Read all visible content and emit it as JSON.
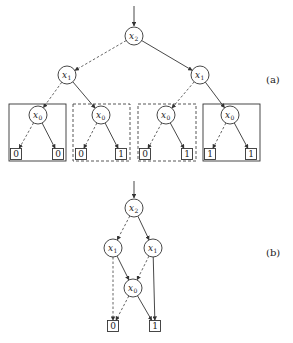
{
  "diagram_a": {
    "label": "(a)",
    "root_arrow": {
      "x": 134,
      "y1": 6,
      "y2": 26
    },
    "nodes": [
      {
        "id": "a-x2",
        "var": "x",
        "sub": "2",
        "cx": 134,
        "cy": 36
      },
      {
        "id": "a-x1-left",
        "var": "x",
        "sub": "1",
        "cx": 67,
        "cy": 75
      },
      {
        "id": "a-x1-right",
        "var": "x",
        "sub": "1",
        "cx": 200,
        "cy": 75
      },
      {
        "id": "a-x0-1",
        "var": "x",
        "sub": "0",
        "cx": 38,
        "cy": 115
      },
      {
        "id": "a-x0-2",
        "var": "x",
        "sub": "0",
        "cx": 101,
        "cy": 115
      },
      {
        "id": "a-x0-3",
        "var": "x",
        "sub": "0",
        "cx": 166,
        "cy": 115
      },
      {
        "id": "a-x0-4",
        "var": "x",
        "sub": "0",
        "cx": 230,
        "cy": 115
      }
    ],
    "leaves": [
      {
        "id": "a-leaf-1",
        "value": "0",
        "cx": 16,
        "cy": 154
      },
      {
        "id": "a-leaf-2",
        "value": "0",
        "cx": 58,
        "cy": 154
      },
      {
        "id": "a-leaf-3",
        "value": "0",
        "cx": 81,
        "cy": 154
      },
      {
        "id": "a-leaf-4",
        "value": "1",
        "cx": 121,
        "cy": 154
      },
      {
        "id": "a-leaf-5",
        "value": "0",
        "cx": 145,
        "cy": 154
      },
      {
        "id": "a-leaf-6",
        "value": "1",
        "cx": 187,
        "cy": 154
      },
      {
        "id": "a-leaf-7",
        "value": "1",
        "cx": 210,
        "cy": 154
      },
      {
        "id": "a-leaf-8",
        "value": "1",
        "cx": 251,
        "cy": 154
      }
    ],
    "edges": [
      {
        "from": "a-x2",
        "to": "a-x1-left",
        "type": "lo"
      },
      {
        "from": "a-x2",
        "to": "a-x1-right",
        "type": "hi"
      },
      {
        "from": "a-x1-left",
        "to": "a-x0-1",
        "type": "lo"
      },
      {
        "from": "a-x1-left",
        "to": "a-x0-2",
        "type": "hi"
      },
      {
        "from": "a-x1-right",
        "to": "a-x0-3",
        "type": "lo"
      },
      {
        "from": "a-x1-right",
        "to": "a-x0-4",
        "type": "hi"
      },
      {
        "from": "a-x0-1",
        "to": "a-leaf-1",
        "type": "lo"
      },
      {
        "from": "a-x0-1",
        "to": "a-leaf-2",
        "type": "hi"
      },
      {
        "from": "a-x0-2",
        "to": "a-leaf-3",
        "type": "lo"
      },
      {
        "from": "a-x0-2",
        "to": "a-leaf-4",
        "type": "hi"
      },
      {
        "from": "a-x0-3",
        "to": "a-leaf-5",
        "type": "lo"
      },
      {
        "from": "a-x0-3",
        "to": "a-leaf-6",
        "type": "hi"
      },
      {
        "from": "a-x0-4",
        "to": "a-leaf-7",
        "type": "lo"
      },
      {
        "from": "a-x0-4",
        "to": "a-leaf-8",
        "type": "hi"
      }
    ],
    "groups": [
      {
        "id": "group-1",
        "style": "solid",
        "x": 9,
        "y": 104,
        "w": 57,
        "h": 57
      },
      {
        "id": "group-2",
        "style": "dashed",
        "x": 73,
        "y": 104,
        "w": 57,
        "h": 57
      },
      {
        "id": "group-3",
        "style": "dashed",
        "x": 138,
        "y": 104,
        "w": 58,
        "h": 57
      },
      {
        "id": "group-4",
        "style": "solid",
        "x": 203,
        "y": 104,
        "w": 57,
        "h": 57
      }
    ],
    "label_pos": {
      "x": 266,
      "y": 83
    }
  },
  "diagram_b": {
    "label": "(b)",
    "root_arrow": {
      "x": 134,
      "y1": 181,
      "y2": 198
    },
    "nodes": [
      {
        "id": "b-x2",
        "var": "x",
        "sub": "2",
        "cx": 134,
        "cy": 208
      },
      {
        "id": "b-x1-left",
        "var": "x",
        "sub": "1",
        "cx": 113,
        "cy": 248
      },
      {
        "id": "b-x1-right",
        "var": "x",
        "sub": "1",
        "cx": 153,
        "cy": 248
      },
      {
        "id": "b-x0",
        "var": "x",
        "sub": "0",
        "cx": 133,
        "cy": 288
      }
    ],
    "leaves": [
      {
        "id": "b-leaf-0",
        "value": "0",
        "cx": 113,
        "cy": 326
      },
      {
        "id": "b-leaf-1",
        "value": "1",
        "cx": 155,
        "cy": 326
      }
    ],
    "edges": [
      {
        "from": "b-x2",
        "to": "b-x1-left",
        "type": "lo"
      },
      {
        "from": "b-x2",
        "to": "b-x1-right",
        "type": "hi"
      },
      {
        "from": "b-x1-left",
        "to": "b-leaf-0",
        "type": "lo"
      },
      {
        "from": "b-x1-left",
        "to": "b-x0",
        "type": "hi"
      },
      {
        "from": "b-x1-right",
        "to": "b-x0",
        "type": "lo"
      },
      {
        "from": "b-x1-right",
        "to": "b-leaf-1",
        "type": "hi"
      },
      {
        "from": "b-x0",
        "to": "b-leaf-0",
        "type": "lo"
      },
      {
        "from": "b-x0",
        "to": "b-leaf-1",
        "type": "hi"
      }
    ],
    "label_pos": {
      "x": 266,
      "y": 256
    }
  },
  "legend": {
    "dashed_edge": "low (0) branch",
    "solid_edge": "high (1) branch"
  }
}
